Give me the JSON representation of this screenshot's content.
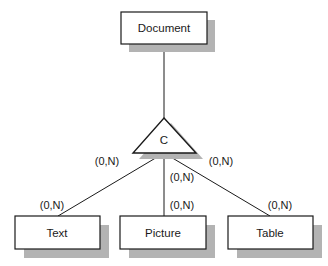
{
  "diagram": {
    "type": "er-generalization",
    "parent": {
      "label": "Document"
    },
    "connector": {
      "label": "C"
    },
    "children": [
      {
        "label": "Text",
        "cardinality": "(0,N)"
      },
      {
        "label": "Picture",
        "cardinality": "(0,N)"
      },
      {
        "label": "Table",
        "cardinality": "(0,N)"
      }
    ],
    "connector_cardinalities": {
      "left": "(0,N)",
      "center": "(0,N)",
      "right": "(0,N)"
    },
    "colors": {
      "stroke": "#1a1a1a",
      "shadow": "#b3b3b3",
      "fill": "#ffffff"
    }
  }
}
